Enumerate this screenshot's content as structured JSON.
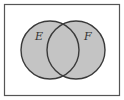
{
  "diagram": {
    "type": "venn",
    "shaded_region": "E union F",
    "sets": [
      {
        "label": "E",
        "cx": 50,
        "cy": 50,
        "r": 29
      },
      {
        "label": "F",
        "cx": 76,
        "cy": 50,
        "r": 29
      }
    ],
    "colors": {
      "fill": "#c4c4c4",
      "stroke": "#3a3a3a",
      "frame": "#555555",
      "background": "#ffffff"
    }
  }
}
